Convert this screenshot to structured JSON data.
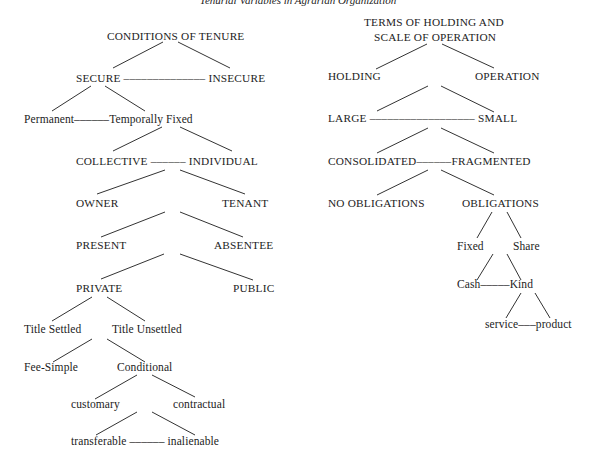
{
  "title": "Tenurial Variables in Agrarian Organization",
  "colors": {
    "background": "#ffffff",
    "text": "#1c1c1c",
    "line": "#333333"
  },
  "left_tree": {
    "root": "CONDITIONS OF TENURE",
    "nodes": [
      {
        "id": "root",
        "text": "CONDITIONS OF TENURE",
        "x": 107,
        "y": 30,
        "caps": true
      },
      {
        "id": "secure",
        "text": "SECURE –––––––––––––– INSECURE",
        "x": 76,
        "y": 72,
        "caps": true
      },
      {
        "id": "permanent",
        "text": "Permanent––––––Temporally Fixed",
        "x": 24,
        "y": 113,
        "caps": false
      },
      {
        "id": "collective",
        "text": "COLLECTIVE –––––– INDIVIDUAL",
        "x": 76,
        "y": 155,
        "caps": true
      },
      {
        "id": "owner",
        "text": "OWNER",
        "x": 76,
        "y": 197,
        "caps": true
      },
      {
        "id": "tenant",
        "text": "TENANT",
        "x": 222,
        "y": 197,
        "caps": true
      },
      {
        "id": "present",
        "text": "PRESENT",
        "x": 76,
        "y": 239,
        "caps": true
      },
      {
        "id": "absentee",
        "text": "ABSENTEE",
        "x": 214,
        "y": 239,
        "caps": true
      },
      {
        "id": "private",
        "text": "PRIVATE",
        "x": 76,
        "y": 282,
        "caps": true
      },
      {
        "id": "public",
        "text": "PUBLIC",
        "x": 233,
        "y": 282,
        "caps": true
      },
      {
        "id": "title_settled",
        "text": "Title Settled",
        "x": 24,
        "y": 323,
        "caps": false
      },
      {
        "id": "title_unsettled",
        "text": "Title Unsettled",
        "x": 112,
        "y": 323,
        "caps": false
      },
      {
        "id": "fee_simple",
        "text": "Fee-Simple",
        "x": 24,
        "y": 361,
        "caps": false
      },
      {
        "id": "conditional",
        "text": "Conditional",
        "x": 117,
        "y": 361,
        "caps": false
      },
      {
        "id": "customary",
        "text": "customary",
        "x": 71,
        "y": 398,
        "caps": false
      },
      {
        "id": "contractual",
        "text": "contractual",
        "x": 173,
        "y": 398,
        "caps": false
      },
      {
        "id": "transferable",
        "text": "transferable –––––– inalienable",
        "x": 71,
        "y": 435,
        "caps": false
      }
    ],
    "edges": [
      [
        163,
        42,
        113,
        68
      ],
      [
        178,
        42,
        230,
        68
      ],
      [
        91,
        86,
        52,
        111
      ],
      [
        105,
        86,
        145,
        111
      ],
      [
        162,
        127,
        113,
        151
      ],
      [
        180,
        127,
        232,
        151
      ],
      [
        165,
        170,
        97,
        194
      ],
      [
        180,
        170,
        245,
        194
      ],
      [
        165,
        212,
        101,
        237
      ],
      [
        180,
        212,
        243,
        237
      ],
      [
        164,
        254,
        101,
        279
      ],
      [
        180,
        254,
        253,
        280
      ],
      [
        92,
        297,
        52,
        321
      ],
      [
        107,
        297,
        145,
        321
      ],
      [
        92,
        339,
        53,
        362
      ],
      [
        107,
        339,
        145,
        362
      ],
      [
        137,
        375,
        95,
        399
      ],
      [
        152,
        375,
        195,
        397
      ],
      [
        137,
        412,
        96,
        435
      ],
      [
        152,
        412,
        195,
        435
      ]
    ]
  },
  "right_tree": {
    "root": "TERMS OF HOLDING AND SCALE OF OPERATION",
    "nodes": [
      {
        "id": "root1",
        "text": "TERMS OF HOLDING AND",
        "x": 364,
        "y": 16,
        "caps": true
      },
      {
        "id": "root2",
        "text": "SCALE OF OPERATION",
        "x": 374,
        "y": 31,
        "caps": true
      },
      {
        "id": "holding",
        "text": "HOLDING",
        "x": 328,
        "y": 70,
        "caps": true
      },
      {
        "id": "operation",
        "text": "OPERATION",
        "x": 475,
        "y": 70,
        "caps": true
      },
      {
        "id": "large",
        "text": "LARGE –––––––––––––––––– SMALL",
        "x": 328,
        "y": 112,
        "caps": true
      },
      {
        "id": "consolidated",
        "text": "CONSOLIDATED––––––FRAGMENTED",
        "x": 328,
        "y": 155,
        "caps": true
      },
      {
        "id": "no_obligations",
        "text": "NO OBLIGATIONS",
        "x": 328,
        "y": 197,
        "caps": true
      },
      {
        "id": "obligations",
        "text": "OBLIGATIONS",
        "x": 462,
        "y": 197,
        "caps": true
      },
      {
        "id": "fixed",
        "text": "Fixed",
        "x": 457,
        "y": 240,
        "caps": false
      },
      {
        "id": "share",
        "text": "Share",
        "x": 513,
        "y": 240,
        "caps": false
      },
      {
        "id": "cash",
        "text": "Cash–––––Kind",
        "x": 457,
        "y": 278,
        "caps": false
      },
      {
        "id": "service",
        "text": "service–––product",
        "x": 485,
        "y": 318,
        "caps": false
      }
    ],
    "edges": [
      [
        427,
        44,
        376,
        69
      ],
      [
        442,
        44,
        494,
        68
      ],
      [
        428,
        86,
        377,
        111
      ],
      [
        441,
        86,
        494,
        112
      ],
      [
        428,
        128,
        377,
        153
      ],
      [
        441,
        128,
        494,
        153
      ],
      [
        428,
        170,
        377,
        195
      ],
      [
        441,
        170,
        494,
        195
      ],
      [
        492,
        212,
        477,
        238
      ],
      [
        507,
        212,
        521,
        238
      ],
      [
        493,
        254,
        477,
        280
      ],
      [
        507,
        254,
        521,
        280
      ],
      [
        521,
        293,
        506,
        318
      ],
      [
        535,
        293,
        550,
        318
      ]
    ]
  }
}
